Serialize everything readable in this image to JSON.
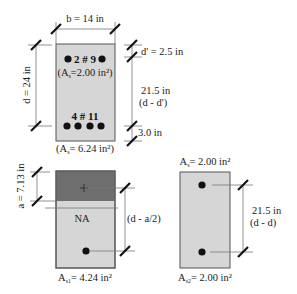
{
  "colors": {
    "concrete": "#d6d6d6",
    "compression_block": "#6e6e6e",
    "bar": "#111111"
  },
  "top_section": {
    "width_label": "b = 14 in",
    "depth_label": "d = 24 in",
    "top_cover_label": "d' = 2.5 in",
    "mid_dim_value": "21.5 in",
    "mid_dim_expr": "(d - d')",
    "bottom_cover_label": "3.0 in",
    "top_bars_label": "2 # 9",
    "top_bars_area_open": "(A",
    "top_bars_area_sub": "s",
    "top_bars_area_rest": "=2.00 in²)",
    "bottom_bars_label": "4 # 11",
    "bottom_bars_area_open": "(A",
    "bottom_bars_area_sub": "s",
    "bottom_bars_area_rest": "= 6.24 in²)",
    "top_bar_count": 2,
    "bottom_bar_count": 4
  },
  "left_section": {
    "a_label": "a = 7.13 in",
    "neutral_axis_label": "NA",
    "lever_arm_label": "(d - a/2)",
    "steel_area_A": "A",
    "steel_area_sub": "s1",
    "steel_area_rest": "= 4.24 in²"
  },
  "right_section": {
    "top_area_A": "A",
    "top_area_sub": "s",
    "top_area_rest": "= 2.00 in²",
    "dim_value": "21.5 in",
    "dim_expr": "(d - d)",
    "bottom_area_A": "A",
    "bottom_area_sub": "s2",
    "bottom_area_rest": "= 2.00 in²"
  }
}
